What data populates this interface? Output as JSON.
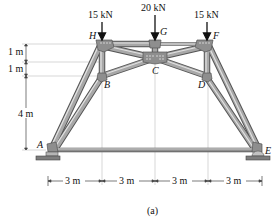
{
  "figure": {
    "caption": "(a)",
    "loads": [
      {
        "id": "load-H",
        "label": "15 kN",
        "joint": "H"
      },
      {
        "id": "load-G",
        "label": "20 kN",
        "joint": "G"
      },
      {
        "id": "load-F",
        "label": "15 kN",
        "joint": "F"
      }
    ],
    "joints": {
      "A": "A",
      "B": "B",
      "C": "C",
      "D": "D",
      "E": "E",
      "F": "F",
      "G": "G",
      "H": "H"
    },
    "vertical_dims": [
      "1 m",
      "1 m",
      "4 m"
    ],
    "horizontal_dims": [
      "3 m",
      "3 m",
      "3 m",
      "3 m"
    ],
    "colors": {
      "member": "#9a9a9a",
      "member_dark": "#5c5c5c",
      "member_light": "#d0d0d0",
      "gusset": "#8a8a8a",
      "support": "#7a7a7a",
      "dim_line": "#444444"
    }
  }
}
